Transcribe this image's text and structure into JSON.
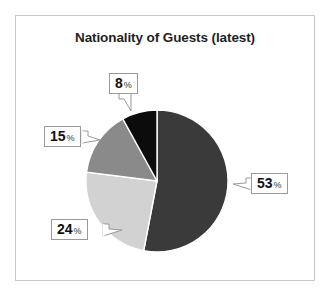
{
  "figure": {
    "background": "#ffffff",
    "frame_color": "#c8c8c8"
  },
  "chart_data": {
    "type": "pie",
    "title": "Nationality of Guests (latest)",
    "categories": [
      "53%",
      "24%",
      "15%",
      "8%"
    ],
    "values": [
      53,
      24,
      15,
      8
    ],
    "value_unit": "%",
    "labels": [
      "53",
      "24",
      "15",
      "8"
    ],
    "percent_symbol": "%",
    "colors": [
      "#3a3a3a",
      "#d2d2d2",
      "#8a8a8a",
      "#0c0c0c"
    ],
    "start_angle_deg": 0,
    "direction": "clockwise",
    "legend": "none",
    "grid": false,
    "xlabel": "",
    "ylabel": ""
  },
  "callouts": [
    {
      "value": "8",
      "percent": "%"
    },
    {
      "value": "15",
      "percent": "%"
    },
    {
      "value": "24",
      "percent": "%"
    },
    {
      "value": "53",
      "percent": "%"
    }
  ]
}
